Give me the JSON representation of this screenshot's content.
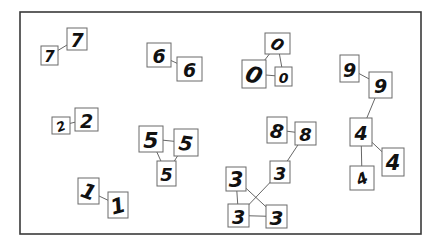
{
  "diagram": {
    "title": "",
    "frame": {
      "x": 20,
      "y": 12,
      "w": 401,
      "h": 222
    },
    "colors": {
      "frame": "#3a3a3a",
      "edge": "#555555",
      "box": "#6a6a6a",
      "digit": "#111111"
    },
    "clusters": [
      {
        "label": "7",
        "nodes": [
          {
            "id": "7a",
            "digit": "7",
            "x": 41,
            "y": 46,
            "w": 17,
            "h": 19,
            "size": 15,
            "style": "normal",
            "rot": 0
          },
          {
            "id": "7b",
            "digit": "7",
            "x": 67,
            "y": 28,
            "w": 20,
            "h": 22,
            "size": 19,
            "style": "bold",
            "rot": 0
          }
        ],
        "edges": [
          [
            "7a",
            "7b"
          ]
        ]
      },
      {
        "label": "6",
        "nodes": [
          {
            "id": "6a",
            "digit": "6",
            "x": 147,
            "y": 43,
            "w": 24,
            "h": 24,
            "size": 19,
            "style": "normal",
            "rot": 0
          },
          {
            "id": "6b",
            "digit": "6",
            "x": 177,
            "y": 57,
            "w": 25,
            "h": 24,
            "size": 19,
            "style": "normal",
            "rot": 0
          }
        ],
        "edges": [
          [
            "6a",
            "6b"
          ]
        ]
      },
      {
        "label": "0",
        "nodes": [
          {
            "id": "0a",
            "digit": "0",
            "x": 265,
            "y": 33,
            "w": 25,
            "h": 21,
            "size": 17,
            "style": "normal",
            "rot": 30
          },
          {
            "id": "0b",
            "digit": "0",
            "x": 242,
            "y": 60,
            "w": 24,
            "h": 28,
            "size": 23,
            "style": "bold",
            "rot": 20
          },
          {
            "id": "0c",
            "digit": "0",
            "x": 275,
            "y": 67,
            "w": 17,
            "h": 19,
            "size": 14,
            "style": "normal",
            "rot": 0
          }
        ],
        "edges": [
          [
            "0a",
            "0b"
          ],
          [
            "0a",
            "0c"
          ],
          [
            "0b",
            "0c"
          ]
        ]
      },
      {
        "label": "9/4",
        "nodes": [
          {
            "id": "9a",
            "digit": "9",
            "x": 340,
            "y": 55,
            "w": 19,
            "h": 27,
            "size": 19,
            "style": "bold",
            "rot": 0
          },
          {
            "id": "9b",
            "digit": "9",
            "x": 369,
            "y": 72,
            "w": 23,
            "h": 26,
            "size": 19,
            "style": "bold",
            "rot": 0
          },
          {
            "id": "4a",
            "digit": "4",
            "x": 350,
            "y": 118,
            "w": 22,
            "h": 28,
            "size": 19,
            "style": "normal",
            "rot": 0
          },
          {
            "id": "4b",
            "digit": "4",
            "x": 382,
            "y": 148,
            "w": 22,
            "h": 28,
            "size": 21,
            "style": "normal",
            "rot": 0
          },
          {
            "id": "4c",
            "digit": "4",
            "x": 350,
            "y": 166,
            "w": 24,
            "h": 24,
            "size": 16,
            "style": "normal",
            "rot": -25
          }
        ],
        "edges": [
          [
            "9a",
            "9b"
          ],
          [
            "9b",
            "4a"
          ],
          [
            "4a",
            "4b"
          ],
          [
            "4a",
            "4c"
          ]
        ]
      },
      {
        "label": "2",
        "nodes": [
          {
            "id": "2a",
            "digit": "2",
            "x": 52,
            "y": 117,
            "w": 18,
            "h": 17,
            "size": 13,
            "style": "normal",
            "rot": -20
          },
          {
            "id": "2b",
            "digit": "2",
            "x": 75,
            "y": 108,
            "w": 23,
            "h": 23,
            "size": 19,
            "style": "bold",
            "rot": 0
          }
        ],
        "edges": [
          [
            "2a",
            "2b"
          ]
        ]
      },
      {
        "label": "5",
        "nodes": [
          {
            "id": "5a",
            "digit": "5",
            "x": 139,
            "y": 126,
            "w": 24,
            "h": 26,
            "size": 22,
            "style": "bold",
            "rot": 0
          },
          {
            "id": "5b",
            "digit": "5",
            "x": 174,
            "y": 129,
            "w": 24,
            "h": 27,
            "size": 20,
            "style": "normal",
            "rot": 8
          },
          {
            "id": "5c",
            "digit": "5",
            "x": 157,
            "y": 161,
            "w": 19,
            "h": 25,
            "size": 18,
            "style": "normal",
            "rot": 0
          }
        ],
        "edges": [
          [
            "5a",
            "5b"
          ],
          [
            "5a",
            "5c"
          ],
          [
            "5b",
            "5c"
          ]
        ]
      },
      {
        "label": "8/3",
        "nodes": [
          {
            "id": "8a",
            "digit": "8",
            "x": 267,
            "y": 117,
            "w": 20,
            "h": 26,
            "size": 19,
            "style": "normal",
            "rot": 10
          },
          {
            "id": "8b",
            "digit": "8",
            "x": 295,
            "y": 122,
            "w": 21,
            "h": 23,
            "size": 18,
            "style": "normal",
            "rot": 0
          },
          {
            "id": "3a",
            "digit": "3",
            "x": 270,
            "y": 161,
            "w": 20,
            "h": 22,
            "size": 18,
            "style": "bold",
            "rot": 0
          },
          {
            "id": "3b",
            "digit": "3",
            "x": 226,
            "y": 167,
            "w": 20,
            "h": 24,
            "size": 21,
            "style": "bold",
            "rot": 0
          },
          {
            "id": "3c",
            "digit": "3",
            "x": 228,
            "y": 204,
            "w": 21,
            "h": 23,
            "size": 19,
            "style": "bold",
            "rot": 0
          },
          {
            "id": "3d",
            "digit": "3",
            "x": 266,
            "y": 205,
            "w": 21,
            "h": 23,
            "size": 20,
            "style": "bold",
            "rot": 0
          }
        ],
        "edges": [
          [
            "8a",
            "8b"
          ],
          [
            "8b",
            "3a"
          ],
          [
            "3a",
            "3c"
          ],
          [
            "3b",
            "3c"
          ],
          [
            "3b",
            "3d"
          ],
          [
            "3c",
            "3d"
          ]
        ]
      },
      {
        "label": "1",
        "nodes": [
          {
            "id": "1a",
            "digit": "1",
            "x": 78,
            "y": 178,
            "w": 21,
            "h": 26,
            "size": 21,
            "style": "bold",
            "rot": 20
          },
          {
            "id": "1b",
            "digit": "1",
            "x": 108,
            "y": 192,
            "w": 20,
            "h": 26,
            "size": 21,
            "style": "bold",
            "rot": -15
          }
        ],
        "edges": [
          [
            "1a",
            "1b"
          ]
        ]
      }
    ]
  }
}
